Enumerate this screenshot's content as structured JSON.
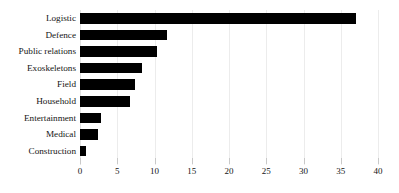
{
  "chart_data": {
    "type": "bar",
    "orientation": "horizontal",
    "title": "",
    "subtitle": "",
    "xlabel": "",
    "ylabel": "",
    "categories": [
      "Logistic",
      "Defence",
      "Public relations",
      "Exoskeletons",
      "Field",
      "Household",
      "Entertainment",
      "Medical",
      "Construction"
    ],
    "values": [
      37,
      11.7,
      10.3,
      8.3,
      7.4,
      6.7,
      2.8,
      2.4,
      0.8
    ],
    "series": [
      {
        "name": "",
        "values": [
          37,
          11.7,
          10.3,
          8.3,
          7.4,
          6.7,
          2.8,
          2.4,
          0.8
        ]
      }
    ],
    "xlim": [
      0,
      40
    ],
    "xticks": [
      0,
      5,
      10,
      15,
      20,
      25,
      30,
      35,
      40
    ],
    "xtick_labels": [
      "0",
      "5",
      "10",
      "15",
      "20",
      "25",
      "30",
      "35",
      "40"
    ],
    "grid": "vertical",
    "legend": "none",
    "bar_color": "#000000",
    "grid_color": "#ececec",
    "background": "#ffffff"
  }
}
